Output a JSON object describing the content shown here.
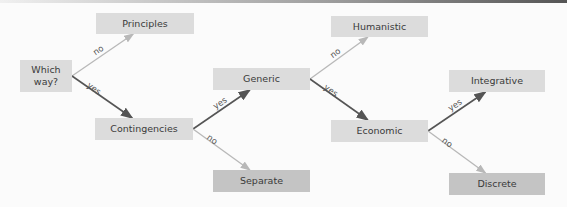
{
  "diagram": {
    "nodes": {
      "root": "Which way?",
      "principles": "Principles",
      "contingencies": "Contingencies",
      "generic": "Generic",
      "separate": "Separate",
      "humanistic": "Humanistic",
      "economic": "Economic",
      "integrative": "Integrative",
      "discrete": "Discrete"
    },
    "edges": [
      {
        "from": "root",
        "to": "principles",
        "label": "no",
        "kind": "no"
      },
      {
        "from": "root",
        "to": "contingencies",
        "label": "yes",
        "kind": "yes"
      },
      {
        "from": "contingencies",
        "to": "generic",
        "label": "yes",
        "kind": "yes"
      },
      {
        "from": "contingencies",
        "to": "separate",
        "label": "no",
        "kind": "no"
      },
      {
        "from": "generic",
        "to": "humanistic",
        "label": "no",
        "kind": "no"
      },
      {
        "from": "generic",
        "to": "economic",
        "label": "yes",
        "kind": "yes"
      },
      {
        "from": "economic",
        "to": "integrative",
        "label": "yes",
        "kind": "yes"
      },
      {
        "from": "economic",
        "to": "discrete",
        "label": "no",
        "kind": "no"
      }
    ],
    "colors": {
      "yes_edge": "#555555",
      "no_edge": "#b8b8b8",
      "node_fill": "#dcdcdc",
      "leaf_fill_dark": "#c4c4c4"
    }
  }
}
